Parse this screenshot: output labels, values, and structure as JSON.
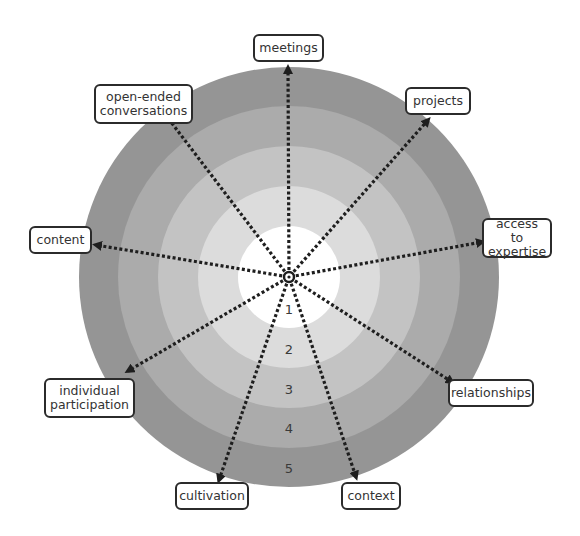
{
  "diagram": {
    "type": "concentric rings with radiating dotted arrows",
    "center": {
      "x": 289,
      "y": 277
    },
    "rings": [
      {
        "level": 5,
        "radius": 210,
        "color": "#959595",
        "label": "5"
      },
      {
        "level": 4,
        "radius": 171,
        "color": "#ababab",
        "label": "4"
      },
      {
        "level": 3,
        "radius": 131,
        "color": "#c3c3c3",
        "label": "3"
      },
      {
        "level": 2,
        "radius": 91,
        "color": "#dcdcdc",
        "label": "2"
      },
      {
        "level": 1,
        "radius": 51,
        "color": "#ffffff",
        "label": "1"
      }
    ],
    "ring_number_positions": [
      {
        "label": "1",
        "x": 289,
        "y": 312
      },
      {
        "label": "2",
        "x": 289,
        "y": 352
      },
      {
        "label": "3",
        "x": 289,
        "y": 392
      },
      {
        "label": "4",
        "x": 289,
        "y": 431
      },
      {
        "label": "5",
        "x": 289,
        "y": 471
      }
    ],
    "spokes": [
      {
        "label": "meetings",
        "end": {
          "x": 288,
          "y": 68
        }
      },
      {
        "label": "projects",
        "end": {
          "x": 428,
          "y": 120
        }
      },
      {
        "label": "access to expertise",
        "end": {
          "x": 482,
          "y": 242
        }
      },
      {
        "label": "relationships",
        "end": {
          "x": 452,
          "y": 382
        }
      },
      {
        "label": "context",
        "end": {
          "x": 356,
          "y": 477
        }
      },
      {
        "label": "cultivation",
        "end": {
          "x": 219,
          "y": 480
        }
      },
      {
        "label": "individual participation",
        "end": {
          "x": 128,
          "y": 371
        }
      },
      {
        "label": "content",
        "end": {
          "x": 96,
          "y": 245
        }
      },
      {
        "label": "open-ended conversations",
        "end": {
          "x": 158,
          "y": 105
        }
      }
    ]
  },
  "labels": {
    "meetings": "meetings",
    "projects": "projects",
    "access_line1": "access to",
    "access_line2": "expertise",
    "relationships": "relationships",
    "context": "context",
    "cultivation": "cultivation",
    "individual_line1": "individual",
    "individual_line2": "participation",
    "content": "content",
    "open_line1": "open-ended",
    "open_line2": "conversations"
  },
  "ring_labels": {
    "r1": "1",
    "r2": "2",
    "r3": "3",
    "r4": "4",
    "r5": "5"
  },
  "colors": {
    "stroke": "#1e1e1e",
    "label_border": "#2b2b2b",
    "text": "#333333"
  }
}
